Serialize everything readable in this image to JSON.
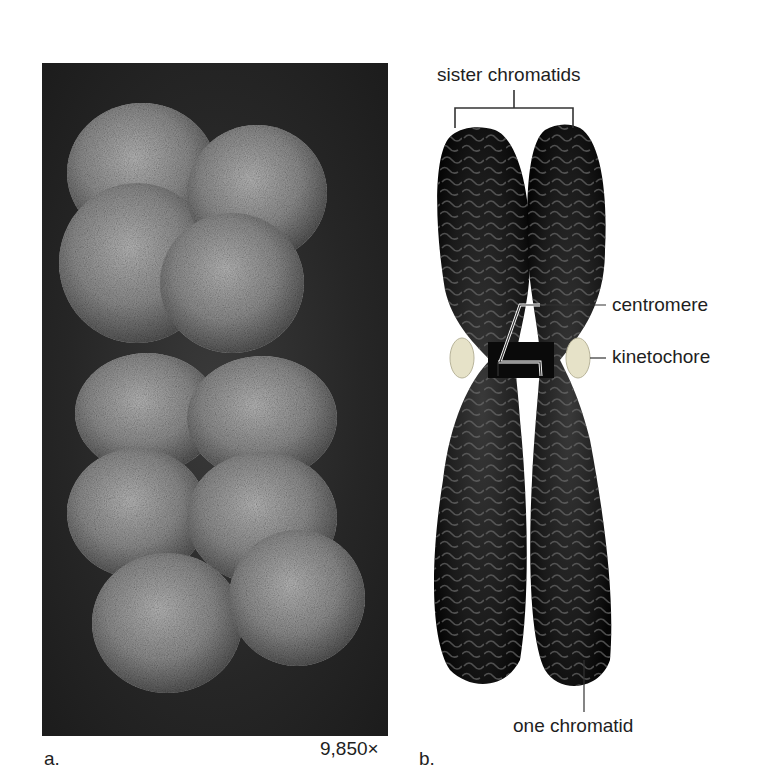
{
  "figure": {
    "panel_a": {
      "label": "a.",
      "magnification": "9,850×",
      "image_description": "scanning electron micrograph of a duplicated chromosome"
    },
    "panel_b": {
      "label": "b.",
      "image_description": "illustration of a duplicated chromosome with two sister chromatids",
      "annotations": {
        "sister_chromatids": "sister chromatids",
        "centromere": "centromere",
        "kinetochore": "kinetochore",
        "one_chromatid": "one chromatid"
      }
    }
  }
}
